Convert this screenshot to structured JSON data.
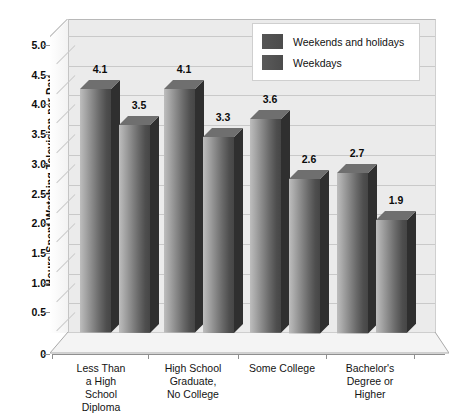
{
  "chart_data": {
    "type": "bar",
    "title": "",
    "xlabel": "",
    "ylabel": "Hours Spent Watching Television per Day",
    "ylim": [
      0,
      5.0
    ],
    "ytick_labels": [
      "0",
      "0.5",
      "1.0",
      "1.5",
      "2.0",
      "2.5",
      "3.0",
      "3.5",
      "4.0",
      "4.5",
      "5.0"
    ],
    "ytick_values": [
      0,
      0.5,
      1.0,
      1.5,
      2.0,
      2.5,
      3.0,
      3.5,
      4.0,
      4.5,
      5.0
    ],
    "grid": true,
    "legend_position": "top-right",
    "categories": [
      "Less Than a High School Diploma",
      "High School Graduate, No College",
      "Some College",
      "Bachelor's Degree or Higher"
    ],
    "category_lines": [
      [
        "Less Than",
        "a High",
        "School",
        "Diploma"
      ],
      [
        "High School",
        "Graduate,",
        "No College"
      ],
      [
        "Some College"
      ],
      [
        "Bachelor's",
        "Degree or",
        "Higher"
      ]
    ],
    "series": [
      {
        "name": "Weekends and holidays",
        "color": "#555555",
        "values": [
          4.1,
          4.1,
          3.6,
          2.7
        ],
        "value_labels": [
          "4.1",
          "4.1",
          "3.6",
          "2.7"
        ]
      },
      {
        "name": "Weekdays",
        "color": "#5a5a5a",
        "values": [
          3.5,
          3.3,
          2.6,
          1.9
        ],
        "value_labels": [
          "3.5",
          "3.3",
          "2.6",
          "1.9"
        ]
      }
    ]
  },
  "legend": {
    "items": [
      {
        "label": "Weekends and holidays"
      },
      {
        "label": "Weekdays"
      }
    ]
  },
  "axes": {
    "y_title": "Hours Spent Watching Television per Day"
  }
}
